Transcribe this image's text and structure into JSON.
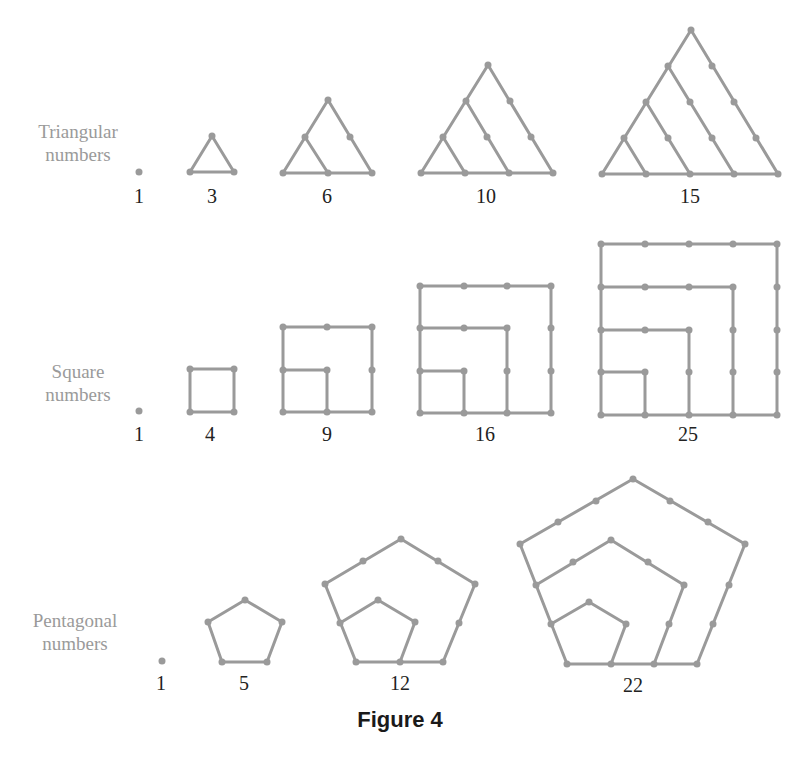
{
  "figure": {
    "caption": "Figure 4",
    "stroke_color": "#9a9a9a",
    "rows": [
      {
        "id": "triangular",
        "label_line1": "Triangular",
        "label_line2": "numbers",
        "items": [
          {
            "value": "1"
          },
          {
            "value": "3"
          },
          {
            "value": "6"
          },
          {
            "value": "10"
          },
          {
            "value": "15"
          }
        ]
      },
      {
        "id": "square",
        "label_line1": "Square",
        "label_line2": "numbers",
        "items": [
          {
            "value": "1"
          },
          {
            "value": "4"
          },
          {
            "value": "9"
          },
          {
            "value": "16"
          },
          {
            "value": "25"
          }
        ]
      },
      {
        "id": "pentagonal",
        "label_line1": "Pentagonal",
        "label_line2": "numbers",
        "items": [
          {
            "value": "1"
          },
          {
            "value": "5"
          },
          {
            "value": "12"
          },
          {
            "value": "22"
          }
        ]
      }
    ]
  }
}
